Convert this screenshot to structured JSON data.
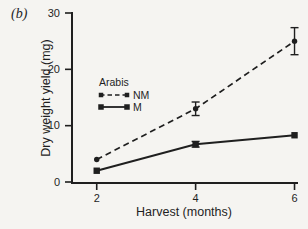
{
  "figure": {
    "panel_label": "(b)",
    "background": "#f5f4f1",
    "ink_color": "#1f1f1f"
  },
  "chart_data": {
    "type": "line",
    "title": "",
    "xlabel": "Harvest (months)",
    "ylabel": "Dry weight yield (mg)",
    "xlim": [
      1.5,
      6.05
    ],
    "ylim": [
      0,
      30
    ],
    "xticks": [
      "2",
      "4",
      "6"
    ],
    "xtick_values": [
      2,
      4,
      6
    ],
    "yticks": [
      "0",
      "10",
      "20",
      "30"
    ],
    "ytick_values": [
      0,
      10,
      20,
      30
    ],
    "grid": false,
    "legend": {
      "title": "Arabis",
      "position": "center-left",
      "entries": [
        "NM",
        "M"
      ]
    },
    "series": [
      {
        "name": "NM",
        "line_style": "dashed",
        "marker": "circle",
        "x": [
          2,
          4,
          6
        ],
        "y": [
          4,
          13,
          25
        ],
        "yerr": [
          0,
          1.2,
          2.4
        ]
      },
      {
        "name": "M",
        "line_style": "solid",
        "marker": "square",
        "x": [
          2,
          4,
          6
        ],
        "y": [
          2,
          6.7,
          8.3
        ],
        "yerr": [
          0,
          0.5,
          0
        ]
      }
    ]
  }
}
